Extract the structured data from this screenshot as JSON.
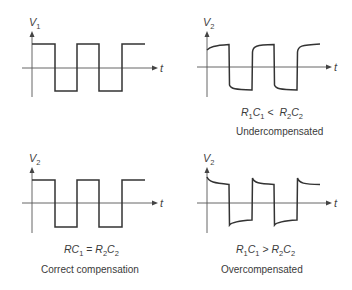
{
  "figure": {
    "panels": [
      {
        "id": "input",
        "y_label": "V",
        "y_label_sub": "1",
        "x_label": "t",
        "waveform": "ideal square wave",
        "condition": "",
        "caption": ""
      },
      {
        "id": "undercompensated",
        "y_label": "V",
        "y_label_sub": "2",
        "x_label": "t",
        "waveform": "rounded leading edges rising toward final level",
        "condition": {
          "lhs": "R",
          "lhs_sub1": "1",
          "lhs_c": "C",
          "lhs_sub2": "1",
          "op": "<",
          "rhs": "R",
          "rhs_sub1": "2",
          "rhs_c": "C",
          "rhs_sub2": "2"
        },
        "caption": "Undercompensated"
      },
      {
        "id": "correct",
        "y_label": "V",
        "y_label_sub": "2",
        "x_label": "t",
        "waveform": "ideal square wave",
        "condition": {
          "lhs": "R",
          "lhs_sub1": "",
          "lhs_c": "C",
          "lhs_sub2": "1",
          "op": "=",
          "rhs": "R",
          "rhs_sub1": "2",
          "rhs_c": "C",
          "rhs_sub2": "2"
        },
        "caption": "Correct compensation"
      },
      {
        "id": "overcompensated",
        "y_label": "V",
        "y_label_sub": "2",
        "x_label": "t",
        "waveform": "overshoot spikes decaying after each edge",
        "condition": {
          "lhs": "R",
          "lhs_sub1": "1",
          "lhs_c": "C",
          "lhs_sub2": "1",
          "op": ">",
          "rhs": "R",
          "rhs_sub1": "2",
          "rhs_c": "C",
          "rhs_sub2": "2"
        },
        "caption": "Overcompensated"
      }
    ]
  }
}
